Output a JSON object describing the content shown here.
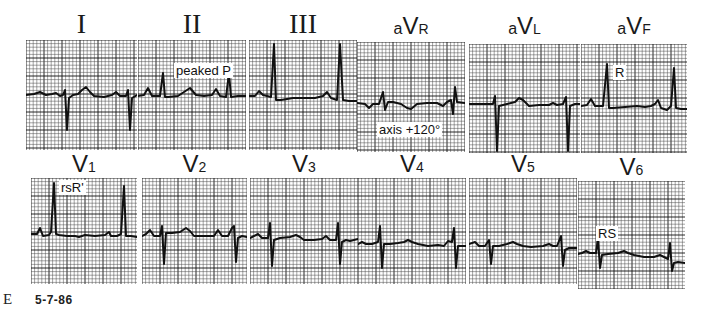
{
  "figure": {
    "panel_letter": "E",
    "date": "5-7-86"
  },
  "colors": {
    "grid_minor": "#4a4a4a",
    "grid_major": "#111111",
    "trace": "#111111",
    "paper": "#ffffff"
  },
  "leads": [
    {
      "id": "I",
      "label": "I",
      "style": "roman",
      "x": 26,
      "y": 40,
      "w": 111,
      "h": 110,
      "label_y": 10,
      "trace": "M0,55 L8,54 L14,52 L20,55 L26,54 L30,53 L34,56 L37,55 L39,50 L41,90 L43,58 L47,55 L52,54 L56,50 L60,47 L64,52 L68,56 L78,57 L86,55 L90,52 L94,56 L100,56 L102,50 L104,90 L106,58 L111,55",
      "annotation": null
    },
    {
      "id": "II",
      "label": "II",
      "style": "roman",
      "x": 138,
      "y": 40,
      "w": 108,
      "h": 110,
      "label_y": 10,
      "trace": "M0,56 L6,55 L10,48 L14,56 L22,56 L25,33 L27,57 L30,57 L40,56 L46,52 L52,48 L58,55 L66,56 L74,55 L78,49 L82,56 L88,57 L91,33 L93,57 L100,56 L108,56",
      "annotation": {
        "text": "peaked P",
        "dx": 36,
        "dy": 23
      }
    },
    {
      "id": "III",
      "label": "III",
      "style": "roman",
      "x": 249,
      "y": 40,
      "w": 108,
      "h": 110,
      "label_y": 10,
      "trace": "M0,56 L6,56 L10,51 L14,55 L22,57 L25,4 L27,60 L32,60 L44,58 L56,58 L66,58 L74,56 L78,52 L82,58 L88,60 L91,4 L94,60 L100,61 L108,61",
      "annotation": null
    },
    {
      "id": "aVR",
      "label_pre": "a",
      "label": "V",
      "label_sub": "R",
      "style": "sans",
      "x": 357,
      "y": 42,
      "w": 108,
      "h": 110,
      "label_y": 14,
      "trace": "M0,61 L8,62 L12,66 L16,62 L22,62 L26,50 L28,68 L31,60 L36,60 L44,62 L50,66 L54,67 L60,62 L70,61 L80,61 L86,64 L90,60 L94,58 L96,72 L98,45 L100,60 L108,61",
      "annotation": {
        "text": "axis +120°",
        "dx": 20,
        "dy": 80
      }
    },
    {
      "id": "aVL",
      "label_pre": "a",
      "label": "V",
      "label_sub": "L",
      "style": "sans",
      "x": 469,
      "y": 44,
      "w": 111,
      "h": 109,
      "label_y": 14,
      "trace": "M0,60 L8,60 L16,60 L24,60 L26,52 L28,107 L30,62 L38,60 L46,58 L50,54 L54,56 L60,62 L70,61 L80,61 L84,59 L88,61 L94,60 L97,53 L99,107 L101,62 L106,60 L111,60",
      "annotation": null
    },
    {
      "id": "aVF",
      "label_pre": "a",
      "label": "V",
      "label_sub": "F",
      "style": "sans",
      "x": 581,
      "y": 44,
      "w": 106,
      "h": 109,
      "label_y": 14,
      "trace": "M0,62 L6,61 L10,55 L14,62 L22,62 L26,20 L28,64 L32,64 L44,63 L56,62 L64,63 L70,62 L74,60 L77,56 L80,64 L86,66 L90,62 L93,24 L95,64 L100,65 L106,65",
      "annotation": {
        "text": "R",
        "dx": 32,
        "dy": 21
      }
    },
    {
      "id": "V1",
      "label": "V",
      "label_sub": "1",
      "style": "sans",
      "x": 31,
      "y": 178,
      "w": 106,
      "h": 106,
      "label_y": 152,
      "trace": "M0,56 L6,56 L9,50 L12,58 L18,57 L20,54 L23,5 L25,56 L28,57 L36,58 L44,58 L48,59 L54,57 L64,58 L74,57 L78,54 L80,58 L86,58 L90,56 L93,8 L95,58 L100,58 L106,59",
      "annotation": {
        "text": "rsR'",
        "dx": 28,
        "dy": 2
      }
    },
    {
      "id": "V2",
      "label": "V",
      "label_sub": "2",
      "style": "sans",
      "x": 142,
      "y": 178,
      "w": 105,
      "h": 106,
      "label_y": 152,
      "trace": "M0,58 L4,56 L8,52 L12,58 L18,58 L20,48 L22,86 L24,55 L30,55 L38,54 L44,50 L48,53 L52,58 L62,58 L72,58 L76,52 L80,58 L86,58 L90,50 L92,48 L94,84 L96,60 L100,58 L105,59",
      "annotation": null
    },
    {
      "id": "V3",
      "label": "V",
      "label_sub": "3",
      "style": "sans",
      "x": 250,
      "y": 178,
      "w": 108,
      "h": 106,
      "label_y": 152,
      "trace": "M0,60 L4,58 L8,56 L12,60 L18,60 L20,45 L22,88 L24,62 L30,60 L40,59 L46,57 L50,59 L54,62 L64,62 L72,61 L76,58 L80,62 L86,62 L88,45 L90,86 L92,64 L96,62 L100,63 L108,61",
      "annotation": null
    },
    {
      "id": "V4",
      "label": "V",
      "label_sub": "4",
      "style": "sans",
      "x": 358,
      "y": 178,
      "w": 108,
      "h": 106,
      "label_y": 152,
      "trace": "M0,66 L4,64 L8,66 L14,66 L20,64 L22,48 L24,90 L26,66 L32,66 L40,65 L46,64 L50,62 L54,64 L60,66 L70,68 L80,67 L86,68 L90,63 L94,64 L96,50 L98,90 L100,68 L108,68",
      "annotation": null
    },
    {
      "id": "V5",
      "label": "V",
      "label_sub": "5",
      "style": "sans",
      "x": 469,
      "y": 178,
      "w": 108,
      "h": 106,
      "label_y": 152,
      "trace": "M0,66 L6,64 L10,68 L16,68 L20,62 L22,86 L24,68 L30,68 L38,66 L44,64 L48,66 L54,68 L62,69 L74,68 L80,66 L84,68 L88,68 L92,58 L94,88 L96,72 L100,70 L108,70",
      "annotation": null
    },
    {
      "id": "V6",
      "label": "V",
      "label_sub": "6",
      "style": "sans",
      "x": 578,
      "y": 181,
      "w": 107,
      "h": 108,
      "label_y": 155,
      "trace": "M0,73 L4,72 L8,70 L12,72 L18,72 L20,58 L22,87 L24,74 L30,73 L40,72 L46,70 L50,72 L56,74 L66,76 L76,76 L82,74 L86,76 L90,78 L92,62 L94,90 L96,82 L100,81 L107,82",
      "annotation": {
        "text": "RS",
        "dx": 18,
        "dy": 45
      }
    }
  ]
}
